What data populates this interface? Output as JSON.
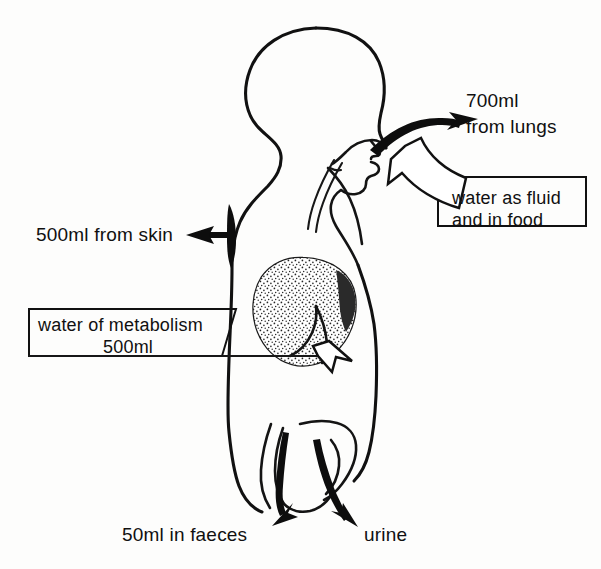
{
  "diagram": {
    "background_color": "#fdfdfc",
    "ink_color": "#111111"
  },
  "labels": {
    "lungs_line1": "700ml",
    "lungs_line2": "from lungs",
    "skin": "500ml from skin",
    "faeces": "50ml in faeces",
    "urine": "urine"
  },
  "callouts": [
    {
      "id": "intake",
      "line1": "water as fluid",
      "line2": "and in food",
      "arrow_style": "hollow",
      "points_to": "mouth"
    },
    {
      "id": "metabolism",
      "line1": "water of metabolism",
      "line2": "500ml",
      "arrow_style": "hollow",
      "points_to": "stomach"
    }
  ],
  "flows": [
    {
      "id": "lungs",
      "label": "700ml from lungs",
      "direction": "out",
      "amount_ml": 700,
      "arrow_style": "solid",
      "origin": "nose-mouth"
    },
    {
      "id": "skin",
      "label": "500ml from skin",
      "direction": "out",
      "amount_ml": 500,
      "arrow_style": "solid",
      "origin": "skin"
    },
    {
      "id": "faeces",
      "label": "50ml in faeces",
      "direction": "out",
      "amount_ml": 50,
      "arrow_style": "solid",
      "origin": "bowel"
    },
    {
      "id": "urine",
      "label": "urine",
      "direction": "out",
      "amount_ml": null,
      "arrow_style": "solid",
      "origin": "bladder"
    },
    {
      "id": "intake",
      "label": "water as fluid and in food",
      "direction": "in",
      "amount_ml": null,
      "arrow_style": "hollow",
      "origin": "mouth"
    },
    {
      "id": "metabolism",
      "label": "water of metabolism 500ml",
      "direction": "in",
      "amount_ml": 500,
      "arrow_style": "hollow",
      "origin": "stomach"
    }
  ],
  "organs": {
    "stomach": {
      "name": "stomach",
      "fill_style": "stippled"
    },
    "trachea": {
      "name": "trachea"
    },
    "bowel": {
      "name": "bowel"
    },
    "bladder": {
      "name": "bladder"
    }
  }
}
